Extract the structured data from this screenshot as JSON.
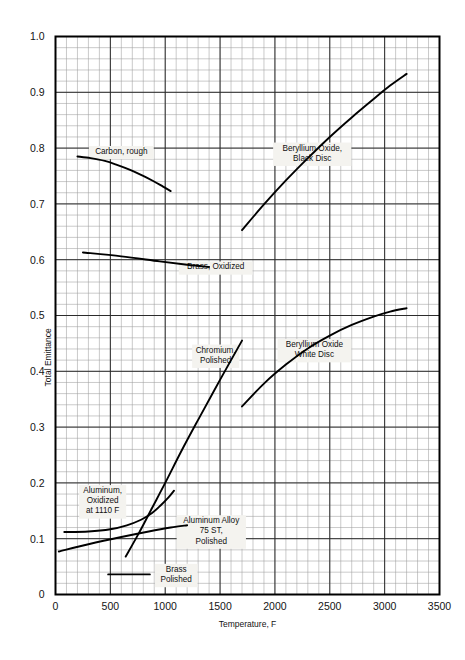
{
  "chart_data": {
    "type": "line",
    "title": "",
    "xlabel": "Temperature, F",
    "ylabel": "Total Emittance",
    "xlim": [
      0,
      3500
    ],
    "ylim": [
      0,
      1.0
    ],
    "grid": true,
    "grid_minor_step_x": 100,
    "grid_minor_step_y": 0.02,
    "grid_major_step_x": 500,
    "grid_major_step_y": 0.1,
    "legend": "inline-annotations",
    "xticks": [
      "0",
      "500",
      "1000",
      "1500",
      "2000",
      "2500",
      "3000",
      "3500"
    ],
    "xtick_values": [
      0,
      500,
      1000,
      1500,
      2000,
      2500,
      3000,
      3500
    ],
    "yticks": [
      "0",
      "0.1",
      "0.2",
      "0.3",
      "0.4",
      "0.5",
      "0.6",
      "0.7",
      "0.8",
      "0.9",
      "1.0"
    ],
    "ytick_values": [
      0,
      0.1,
      0.2,
      0.3,
      0.4,
      0.5,
      0.6,
      0.7,
      0.8,
      0.9,
      1.0
    ],
    "series": [
      {
        "name": "Carbon, rough",
        "label": "Carbon, rough",
        "label_lines": [
          "Carbon, rough"
        ],
        "label_x": 600,
        "label_y": 0.792,
        "color": "#000000",
        "points": [
          [
            200,
            0.785
          ],
          [
            320,
            0.782
          ],
          [
            450,
            0.777
          ],
          [
            560,
            0.77
          ],
          [
            680,
            0.761
          ],
          [
            790,
            0.751
          ],
          [
            890,
            0.741
          ],
          [
            980,
            0.731
          ],
          [
            1050,
            0.723
          ]
        ]
      },
      {
        "name": "Brass, Oxidized",
        "label": "Brass, Oxidized",
        "label_lines": [
          "Brass, Oxidized"
        ],
        "label_x": 1460,
        "label_y": 0.585,
        "color": "#000000",
        "points": [
          [
            250,
            0.613
          ],
          [
            600,
            0.606
          ],
          [
            950,
            0.597
          ],
          [
            1200,
            0.591
          ],
          [
            1400,
            0.587
          ]
        ]
      },
      {
        "name": "Beryllium Oxide, Black Disc",
        "label": "Beryllium Oxide, Black Disc",
        "label_lines": [
          "Beryllium Oxide,",
          "Black Disc"
        ],
        "label_x": 2340,
        "label_y": 0.789,
        "color": "#000000",
        "points": [
          [
            1700,
            0.653
          ],
          [
            1900,
            0.699
          ],
          [
            2100,
            0.742
          ],
          [
            2300,
            0.782
          ],
          [
            2500,
            0.82
          ],
          [
            2700,
            0.855
          ],
          [
            2900,
            0.888
          ],
          [
            3050,
            0.912
          ],
          [
            3200,
            0.933
          ]
        ]
      },
      {
        "name": "Beryllium Oxide White Disc",
        "label": "Beryllium Oxide White Disc",
        "label_lines": [
          "Beryllium Oxide",
          "White Disc"
        ],
        "label_x": 2360,
        "label_y": 0.437,
        "color": "#000000",
        "points": [
          [
            1700,
            0.337
          ],
          [
            1900,
            0.378
          ],
          [
            2100,
            0.412
          ],
          [
            2300,
            0.441
          ],
          [
            2500,
            0.464
          ],
          [
            2700,
            0.483
          ],
          [
            2900,
            0.498
          ],
          [
            3050,
            0.507
          ],
          [
            3200,
            0.513
          ]
        ]
      },
      {
        "name": "Chromium, Polished",
        "label": "Chromium, Polished",
        "label_lines": [
          "Chromium,",
          "Polished"
        ],
        "label_x": 1460,
        "label_y": 0.427,
        "color": "#000000",
        "points": [
          [
            640,
            0.068
          ],
          [
            760,
            0.11
          ],
          [
            880,
            0.155
          ],
          [
            1000,
            0.2
          ],
          [
            1150,
            0.258
          ],
          [
            1300,
            0.313
          ],
          [
            1450,
            0.367
          ],
          [
            1600,
            0.42
          ],
          [
            1700,
            0.455
          ]
        ]
      },
      {
        "name": "Aluminum, Oxidized at 1110 F",
        "label": "Aluminum, Oxidized at 1110 F",
        "label_lines": [
          "Aluminum,",
          "Oxidized",
          "at 1110 F"
        ],
        "label_x": 430,
        "label_y": 0.166,
        "color": "#000000",
        "points": [
          [
            80,
            0.112
          ],
          [
            300,
            0.113
          ],
          [
            500,
            0.117
          ],
          [
            650,
            0.124
          ],
          [
            780,
            0.134
          ],
          [
            880,
            0.146
          ],
          [
            960,
            0.16
          ],
          [
            1030,
            0.174
          ],
          [
            1080,
            0.186
          ]
        ]
      },
      {
        "name": "Aluminum Alloy 75 ST, Polished",
        "label": "Aluminum Alloy 75 ST, Polished",
        "label_lines": [
          "Aluminum Alloy",
          "75 ST,",
          "Polished"
        ],
        "label_x": 1420,
        "label_y": 0.112,
        "color": "#000000",
        "points": [
          [
            30,
            0.077
          ],
          [
            300,
            0.09
          ],
          [
            600,
            0.103
          ],
          [
            850,
            0.113
          ],
          [
            1050,
            0.12
          ],
          [
            1200,
            0.124
          ]
        ]
      },
      {
        "name": "Brass Polished",
        "label": "Brass Polished",
        "label_lines": [
          "Brass",
          "Polished"
        ],
        "label_x": 1100,
        "label_y": 0.034,
        "color": "#000000",
        "points": [
          [
            480,
            0.036
          ],
          [
            860,
            0.036
          ]
        ]
      }
    ]
  }
}
